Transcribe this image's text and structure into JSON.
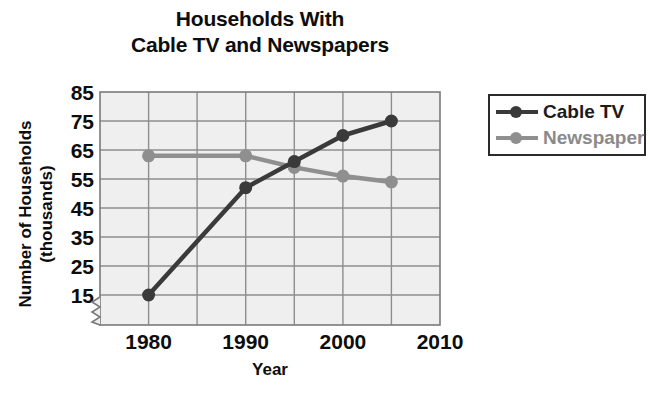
{
  "chart_data": {
    "type": "line",
    "title": "Households With Cable TV and Newspapers",
    "title_line1": "Households With",
    "title_line2": "Cable TV and Newspapers",
    "xlabel": "Year",
    "ylabel": "Number of Households (thousands)",
    "ylabel_line1": "Number of Households",
    "ylabel_line2": "(thousands)",
    "x": [
      1980,
      1990,
      1995,
      2000,
      2005
    ],
    "xticks": [
      "1980",
      "1990",
      "2000",
      "2010"
    ],
    "xtick_values": [
      1980,
      1990,
      2000,
      2010
    ],
    "xlim": [
      1975,
      2010
    ],
    "yticks": [
      "85",
      "75",
      "65",
      "55",
      "45",
      "35",
      "25",
      "15"
    ],
    "ytick_values": [
      85,
      75,
      65,
      55,
      45,
      35,
      25,
      15
    ],
    "ylim": [
      10,
      85
    ],
    "y_axis_break": true,
    "grid": true,
    "legend_position": "right",
    "series": [
      {
        "name": "Cable TV",
        "color": "#3a3a3a",
        "values": [
          15,
          52,
          61,
          70,
          75
        ]
      },
      {
        "name": "Newspaper",
        "color": "#8f8f8f",
        "values": [
          63,
          63,
          59,
          56,
          54
        ]
      }
    ]
  },
  "legend": {
    "items": [
      {
        "label": "Cable TV",
        "color": "#3a3a3a"
      },
      {
        "label": "Newspaper",
        "color": "#8f8f8f"
      }
    ]
  },
  "colors": {
    "cable_tv": "#3a3a3a",
    "newspaper": "#8f8f8f",
    "plot_background": "#efefef",
    "grid": "#8e8e8e",
    "axis": "#6f6f6f",
    "text": "#0d0d0d"
  }
}
